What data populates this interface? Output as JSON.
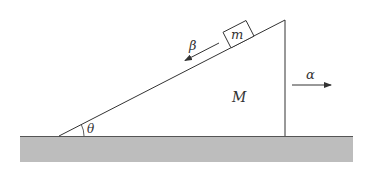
{
  "diagram": {
    "type": "physics-free-body",
    "labels": {
      "block_mass": "m",
      "wedge_mass": "M",
      "incline_angle": "θ",
      "block_accel": "β",
      "wedge_accel": "α"
    },
    "colors": {
      "line": "#333333",
      "ground_fill": "#bdbdbd",
      "ground_edge": "#555555",
      "background": "#ffffff"
    }
  }
}
